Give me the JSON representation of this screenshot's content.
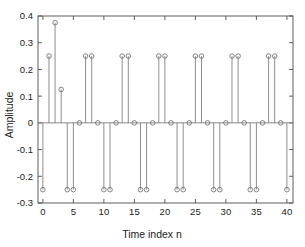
{
  "chart_data": {
    "type": "scatter",
    "plot_style": "stem",
    "title": "",
    "subtitle": "",
    "xlabel": "Time index n",
    "ylabel": "Amplitude",
    "xlim": [
      -0.8,
      41.0
    ],
    "ylim": [
      -0.3,
      0.4
    ],
    "xticks": [
      0,
      5,
      10,
      15,
      20,
      25,
      30,
      35,
      40
    ],
    "xtick_labels": [
      "0",
      "5",
      "10",
      "15",
      "20",
      "25",
      "30",
      "35",
      "40"
    ],
    "yticks": [
      -0.3,
      -0.2,
      -0.1,
      0,
      0.1,
      0.2,
      0.3,
      0.4
    ],
    "ytick_labels": [
      "-0.3",
      "-0.2",
      "-0.1",
      "0",
      "0.1",
      "0.2",
      "0.3",
      "0.4"
    ],
    "grid": false,
    "legend": null,
    "annotations": [],
    "marker": "open-circle",
    "line_color": "#7a7a7a",
    "marker_edge_color": "#6e6e6e",
    "marker_face_color": "none",
    "baseline": 0,
    "x": [
      0,
      1,
      2,
      3,
      4,
      5,
      6,
      7,
      8,
      9,
      10,
      11,
      12,
      13,
      14,
      15,
      16,
      17,
      18,
      19,
      20,
      21,
      22,
      23,
      24,
      25,
      26,
      27,
      28,
      29,
      30,
      31,
      32,
      33,
      34,
      35,
      36,
      37,
      38,
      39,
      40
    ],
    "values": [
      -0.25,
      0.25,
      0.375,
      0.125,
      -0.25,
      -0.25,
      0,
      0.25,
      0.25,
      0,
      -0.25,
      -0.25,
      0,
      0.25,
      0.25,
      0,
      -0.25,
      -0.25,
      0,
      0.25,
      0.25,
      0,
      -0.25,
      -0.25,
      0,
      0.25,
      0.25,
      0,
      -0.25,
      -0.25,
      0,
      0.25,
      0.25,
      0,
      -0.25,
      -0.25,
      0,
      0.25,
      0.25,
      0,
      -0.25
    ]
  },
  "axes": {
    "xlabel": "Time index n",
    "ylabel": "Amplitude"
  }
}
